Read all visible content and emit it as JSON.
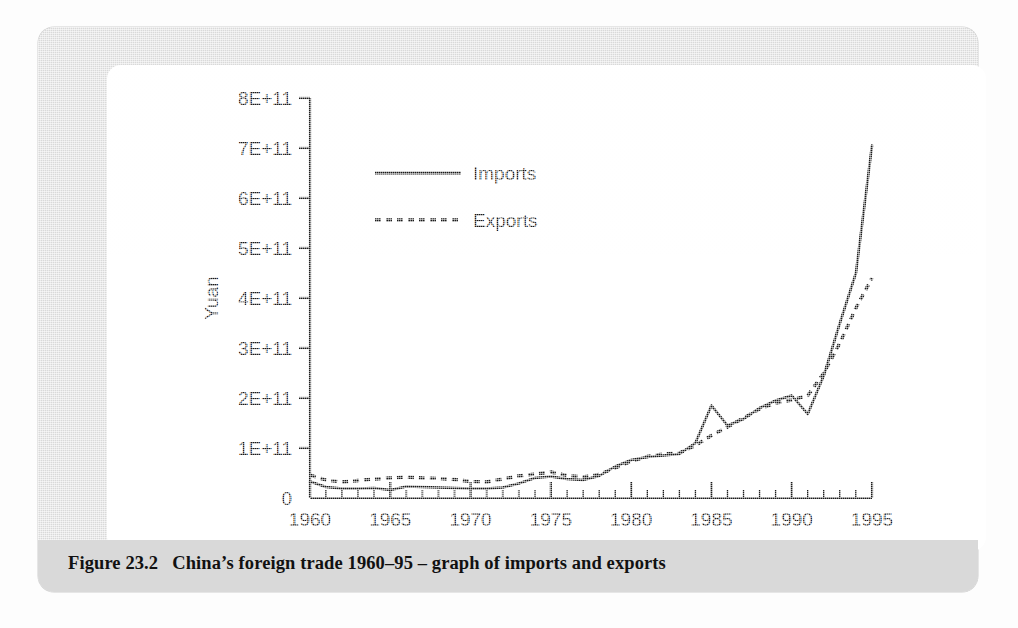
{
  "figure": {
    "caption_label": "Figure 23.2",
    "caption_text": "China’s foreign trade 1960–95 – graph of imports and exports",
    "frame_color": "#d9d9d9",
    "canvas_color": "#ffffff",
    "ink_color": "#1a1a1a"
  },
  "chart_data": {
    "type": "line",
    "title": "",
    "subtitle": "",
    "xlabel": "Year",
    "ylabel": "Yuan",
    "xlim": [
      1960,
      1995
    ],
    "ylim": [
      0,
      800000000000
    ],
    "grid": false,
    "legend_position": "upper-left-inside",
    "x_tick_labels": [
      "1960",
      "1965",
      "1970",
      "1975",
      "1980",
      "1985",
      "1990",
      "1995"
    ],
    "x_major_ticks": [
      1960,
      1965,
      1970,
      1975,
      1980,
      1985,
      1990,
      1995
    ],
    "x_minor_tick_step": 1,
    "y_tick_labels": [
      "0",
      "1E+11",
      "2E+11",
      "3E+11",
      "4E+11",
      "5E+11",
      "6E+11",
      "7E+11",
      "8E+11"
    ],
    "y_major_ticks": [
      0,
      100000000000,
      200000000000,
      300000000000,
      400000000000,
      500000000000,
      600000000000,
      700000000000,
      800000000000
    ],
    "x": [
      1960,
      1961,
      1962,
      1963,
      1964,
      1965,
      1966,
      1967,
      1968,
      1969,
      1970,
      1971,
      1972,
      1973,
      1974,
      1975,
      1976,
      1977,
      1978,
      1979,
      1980,
      1981,
      1982,
      1983,
      1984,
      1985,
      1986,
      1987,
      1988,
      1989,
      1990,
      1991,
      1992,
      1993,
      1994,
      1995
    ],
    "series": [
      {
        "name": "Imports",
        "style": "solid",
        "color": "#1a1a1a",
        "values": [
          33000000000,
          22000000000,
          19000000000,
          19000000000,
          20000000000,
          16000000000,
          23000000000,
          22000000000,
          21000000000,
          20000000000,
          19000000000,
          19000000000,
          21000000000,
          29000000000,
          40000000000,
          43000000000,
          38000000000,
          36000000000,
          44000000000,
          63000000000,
          76000000000,
          82000000000,
          85000000000,
          88000000000,
          110000000000,
          185000000000,
          145000000000,
          158000000000,
          180000000000,
          195000000000,
          205000000000,
          168000000000,
          245000000000,
          350000000000,
          450000000000,
          705000000000
        ]
      },
      {
        "name": "Exports",
        "style": "dashed",
        "color": "#1a1a1a",
        "values": [
          46000000000,
          36000000000,
          32000000000,
          35000000000,
          38000000000,
          40000000000,
          42000000000,
          40000000000,
          39000000000,
          37000000000,
          33000000000,
          32000000000,
          38000000000,
          44000000000,
          48000000000,
          52000000000,
          45000000000,
          42000000000,
          47000000000,
          60000000000,
          73000000000,
          83000000000,
          88000000000,
          90000000000,
          105000000000,
          125000000000,
          142000000000,
          160000000000,
          178000000000,
          190000000000,
          196000000000,
          205000000000,
          250000000000,
          310000000000,
          380000000000,
          440000000000
        ]
      }
    ]
  },
  "legend": {
    "entries": [
      {
        "label": "Imports",
        "style": "solid"
      },
      {
        "label": "Exports",
        "style": "dashed"
      }
    ]
  }
}
